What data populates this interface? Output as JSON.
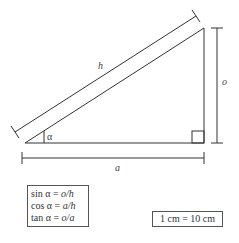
{
  "diagram": {
    "type": "right-triangle",
    "labels": {
      "hypotenuse": "h",
      "opposite": "o",
      "adjacent": "a",
      "angle": "α"
    },
    "formulas": [
      {
        "fn": "sin α =",
        "expr": "o/h"
      },
      {
        "fn": "cos α =",
        "expr": "a/h"
      },
      {
        "fn": "tan α =",
        "expr": "o/a"
      }
    ],
    "scale": "1 cm = 10 cm",
    "colors": {
      "line": "#333333",
      "background": "#ffffff"
    }
  }
}
